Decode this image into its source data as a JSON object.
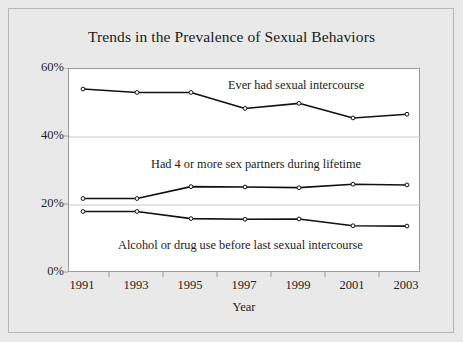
{
  "chart_data": {
    "type": "line",
    "title": "Trends in the Prevalence of Sexual Behaviors",
    "xlabel": "Year",
    "ylabel": "",
    "x": [
      1991,
      1993,
      1995,
      1997,
      1999,
      2001,
      2003
    ],
    "categories": [
      "1991",
      "1993",
      "1995",
      "1997",
      "1999",
      "2001",
      "2003"
    ],
    "xtick_labels": [
      "1991",
      "1993",
      "1995",
      "1997",
      "1999",
      "2001",
      "2003"
    ],
    "ytick_labels": [
      "0%",
      "20%",
      "40%",
      "60%"
    ],
    "ytick_values": [
      0,
      20,
      40,
      60
    ],
    "ylim": [
      0,
      60
    ],
    "xlim": [
      1991,
      2003
    ],
    "grid": "horizontal",
    "legend_position": "inline-annotations",
    "series": [
      {
        "name": "Ever had sexual intercourse",
        "annotation": "Ever had sexual intercourse",
        "values": [
          54.1,
          53.1,
          53.1,
          48.4,
          49.9,
          45.6,
          46.7
        ],
        "color": "#111111",
        "marker": "open-circle"
      },
      {
        "name": "Had 4 or more sex partners during lifetime",
        "annotation": "Had 4 or more sex partners during lifetime",
        "values": [
          21.9,
          21.9,
          25.4,
          25.3,
          25.1,
          26.1,
          25.9
        ],
        "color": "#111111",
        "marker": "open-circle"
      },
      {
        "name": "Alcohol or drug use before last sexual intercourse",
        "annotation": "Alcohol or drug use before last sexual intercourse",
        "values": [
          18.1,
          18.1,
          16.0,
          15.8,
          15.9,
          13.9,
          13.8
        ],
        "color": "#111111",
        "marker": "open-circle"
      }
    ]
  },
  "figure": {
    "background_color": "#e9e9e9",
    "plot_background_color": "#ffffff",
    "frame_color": "#b7b7b7",
    "axis_color": "#9a9a9a",
    "gridline_color": "#c8c8c8",
    "line_color": "#111111"
  }
}
